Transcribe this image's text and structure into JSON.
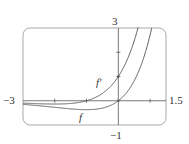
{
  "chart_data": {
    "type": "line",
    "title": "",
    "xlabel": "",
    "ylabel": "",
    "xlim": [
      -3,
      1.5
    ],
    "ylim": [
      -1,
      3
    ],
    "grid": false,
    "legend": "inline curve labels",
    "tick_labels": {
      "x_min": "−3",
      "x_max": "1.5",
      "y_min": "−1",
      "y_max": "3"
    },
    "x_ticks": [
      -2,
      -1,
      1
    ],
    "y_ticks": [
      1,
      2
    ],
    "series": [
      {
        "name": "f",
        "label": "f",
        "formula": "x*e^x",
        "x": [
          -3,
          -2.5,
          -2,
          -1.5,
          -1,
          -0.5,
          0,
          0.5,
          1,
          1.05
        ],
        "values": [
          -0.149,
          -0.205,
          -0.271,
          -0.335,
          -0.368,
          -0.303,
          0,
          0.824,
          2.718,
          3.0
        ]
      },
      {
        "name": "f'",
        "label": "f′",
        "formula": "(x+1)*e^x",
        "x": [
          -3,
          -2.5,
          -2,
          -1.5,
          -1,
          -0.5,
          0,
          0.25,
          0.5,
          0.56
        ],
        "values": [
          -0.1,
          -0.123,
          -0.135,
          -0.112,
          0,
          0.303,
          1.0,
          1.605,
          2.473,
          2.739
        ]
      }
    ],
    "annotations": [
      {
        "text": "f′",
        "near": "f' curve around x=-0.55, y=0.9"
      },
      {
        "text": "f",
        "near": "f curve below minimum around x=-1.3"
      }
    ]
  },
  "colors": {
    "frame": "#a9a9a9",
    "axes": "#555555",
    "curve": "#5a5a5a",
    "text": "#333333"
  }
}
